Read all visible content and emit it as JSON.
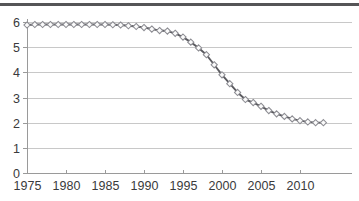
{
  "figure": {
    "has_top_rule": true,
    "background_color": "#ffffff",
    "border_color": "#555557"
  },
  "chart_data": {
    "type": "line",
    "title": "",
    "subtitle": "",
    "xlabel": "",
    "ylabel": "",
    "xlim": [
      1975,
      2013
    ],
    "ylim": [
      0,
      6
    ],
    "grid": "horizontal",
    "legend": "none",
    "line_color": "#5b5b60",
    "marker_color": "#8d8d93",
    "marker_fill": "#fbfbfb",
    "marker_shape": "diamond",
    "gridline_color": "#c8c8c8",
    "axis_color": "#9a9a9a",
    "ytick_labels": [
      "0",
      "1",
      "2",
      "3",
      "4",
      "5",
      "6"
    ],
    "ytick_values": [
      0,
      1,
      2,
      3,
      4,
      5,
      6
    ],
    "xtick_labels": [
      "1975",
      "1980",
      "1985",
      "1990",
      "1995",
      "2000",
      "2005",
      "2010"
    ],
    "xtick_values": [
      1975,
      1980,
      1985,
      1990,
      1995,
      2000,
      2005,
      2010
    ],
    "x": [
      1975,
      1976,
      1977,
      1978,
      1979,
      1980,
      1981,
      1982,
      1983,
      1984,
      1985,
      1986,
      1987,
      1988,
      1989,
      1990,
      1991,
      1992,
      1993,
      1994,
      1995,
      1996,
      1997,
      1998,
      1999,
      2000,
      2001,
      2002,
      2003,
      2004,
      2005,
      2006,
      2007,
      2008,
      2009,
      2010,
      2011,
      2012,
      2013
    ],
    "values": [
      5.88,
      5.9,
      5.9,
      5.9,
      5.9,
      5.9,
      5.9,
      5.9,
      5.9,
      5.9,
      5.9,
      5.89,
      5.88,
      5.85,
      5.82,
      5.78,
      5.72,
      5.66,
      5.64,
      5.55,
      5.4,
      5.2,
      4.97,
      4.7,
      4.3,
      3.9,
      3.55,
      3.2,
      2.92,
      2.8,
      2.65,
      2.48,
      2.35,
      2.25,
      2.15,
      2.08,
      2.03,
      2.0,
      2.0
    ]
  }
}
